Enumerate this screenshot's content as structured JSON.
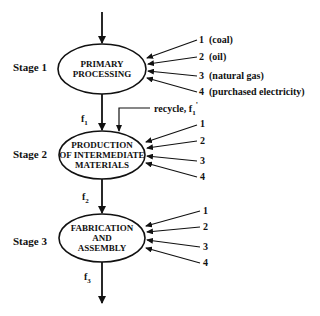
{
  "diagram": {
    "type": "process flow",
    "stages": [
      {
        "label": "Stage 1",
        "node_lines": [
          "PRIMARY",
          "PROCESSING"
        ],
        "inputs": [
          {
            "num": "1",
            "text": "1  (coal)"
          },
          {
            "num": "2",
            "text": "2  (oil)"
          },
          {
            "num": "3",
            "text": "3  (natural gas)"
          },
          {
            "num": "4",
            "text": "4  (purchased electricity)"
          }
        ],
        "output_flow": {
          "base": "f",
          "sub": "1"
        }
      },
      {
        "label": "Stage 2",
        "node_lines": [
          "PRODUCTION",
          "OF INTERMEDIATE",
          "MATERIALS"
        ],
        "inputs": [
          {
            "num": "1",
            "text": "1"
          },
          {
            "num": "2",
            "text": "2"
          },
          {
            "num": "3",
            "text": "3"
          },
          {
            "num": "4",
            "text": "4"
          }
        ],
        "recycle": {
          "text": "recycle, f",
          "sub": "1",
          "prime": "'"
        },
        "output_flow": {
          "base": "f",
          "sub": "2"
        }
      },
      {
        "label": "Stage 3",
        "node_lines": [
          "FABRICATION",
          "AND",
          "ASSEMBLY"
        ],
        "inputs": [
          {
            "num": "1",
            "text": "1"
          },
          {
            "num": "2",
            "text": "2"
          },
          {
            "num": "3",
            "text": "3"
          },
          {
            "num": "4",
            "text": "4"
          }
        ],
        "output_flow": {
          "base": "f",
          "sub": "3"
        }
      }
    ],
    "colors": {
      "stroke": "#111111",
      "background": "#ffffff"
    }
  }
}
